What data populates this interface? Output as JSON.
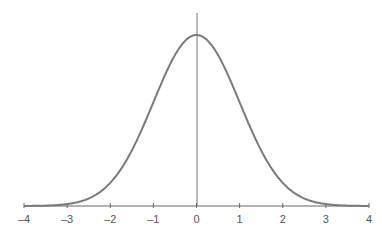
{
  "chart_data": {
    "type": "line",
    "title": "",
    "xlabel": "",
    "ylabel": "",
    "xlim": [
      -4,
      4
    ],
    "ylim": [
      0,
      0.4
    ],
    "grid": false,
    "x_ticks": [
      -4,
      -3,
      -2,
      -1,
      0,
      1,
      2,
      3,
      4
    ],
    "x_tick_labels": [
      "–4",
      "–3",
      "–2",
      "–1",
      "0",
      "1",
      "2",
      "3",
      "4"
    ],
    "series": [
      {
        "name": "normal pdf",
        "x": [
          -4,
          -3,
          -2,
          -1,
          0,
          1,
          2,
          3,
          4
        ],
        "y": [
          0.0001,
          0.0044,
          0.054,
          0.242,
          0.399,
          0.242,
          0.054,
          0.0044,
          0.0001
        ]
      }
    ],
    "colors": {
      "curve": "#7a7a7a",
      "axis": "#666666",
      "center_line": "#777777"
    }
  }
}
